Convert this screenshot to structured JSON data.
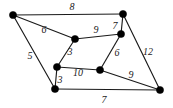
{
  "figure": {
    "kind": "weighted-undirected-graph",
    "width": 173,
    "height": 108,
    "background_color": "#ffffff",
    "vertex_color": "#000000",
    "edge_color": "#1a1a1a",
    "label_color": "#1a1a1a"
  },
  "chart_data": {
    "type": "diagram",
    "title": "",
    "xlabel": "",
    "ylabel": "",
    "graph_type": "weighted undirected graph",
    "node_count": 8,
    "edge_count": 12,
    "nodes": [
      {
        "id": "A",
        "x": 13,
        "y": 15,
        "r": 3.6
      },
      {
        "id": "B",
        "x": 123,
        "y": 14,
        "r": 3.6
      },
      {
        "id": "C",
        "x": 75,
        "y": 39,
        "r": 3.6
      },
      {
        "id": "D",
        "x": 121,
        "y": 34,
        "r": 3.6
      },
      {
        "id": "E",
        "x": 57,
        "y": 67,
        "r": 3.6
      },
      {
        "id": "F",
        "x": 100,
        "y": 70,
        "r": 3.6
      },
      {
        "id": "G",
        "x": 55,
        "y": 89,
        "r": 3.6
      },
      {
        "id": "H",
        "x": 160,
        "y": 90,
        "r": 3.6
      }
    ],
    "edges": [
      {
        "id": "AB",
        "source": "A",
        "target": "B",
        "weight": 8,
        "label": "8",
        "label_x": 72,
        "label_y": 7
      },
      {
        "id": "AC",
        "source": "A",
        "target": "C",
        "weight": 6,
        "label": "6",
        "label_x": 44,
        "label_y": 30
      },
      {
        "id": "AG",
        "source": "A",
        "target": "G",
        "weight": 5,
        "label": "5",
        "label_x": 30,
        "label_y": 56
      },
      {
        "id": "CD",
        "source": "C",
        "target": "D",
        "weight": 9,
        "label": "9",
        "label_x": 96,
        "label_y": 30
      },
      {
        "id": "BD",
        "source": "B",
        "target": "D",
        "weight": 7,
        "label": "7",
        "label_x": 115,
        "label_y": 26
      },
      {
        "id": "BH",
        "source": "B",
        "target": "H",
        "weight": 12,
        "label": "12",
        "label_x": 148,
        "label_y": 52
      },
      {
        "id": "CE",
        "source": "C",
        "target": "E",
        "weight": 3,
        "label": "3",
        "label_x": 70,
        "label_y": 52
      },
      {
        "id": "DF",
        "source": "D",
        "target": "F",
        "weight": 6,
        "label": "6",
        "label_x": 117,
        "label_y": 53
      },
      {
        "id": "EF",
        "source": "E",
        "target": "F",
        "weight": 10,
        "label": "10",
        "label_x": 78,
        "label_y": 73
      },
      {
        "id": "EG",
        "source": "E",
        "target": "G",
        "weight": 3,
        "label": "3",
        "label_x": 60,
        "label_y": 80
      },
      {
        "id": "FH",
        "source": "F",
        "target": "H",
        "weight": 9,
        "label": "9",
        "label_x": 131,
        "label_y": 75
      },
      {
        "id": "GH",
        "source": "G",
        "target": "H",
        "weight": 7,
        "label": "7",
        "label_x": 104,
        "label_y": 100
      }
    ],
    "weights": [
      8,
      6,
      5,
      9,
      7,
      12,
      3,
      6,
      10,
      3,
      9,
      7
    ]
  }
}
